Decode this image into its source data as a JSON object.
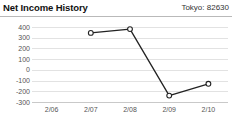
{
  "header": {
    "title": "Net Income History",
    "meta": "Tokyo: 82630"
  },
  "chart_data": {
    "type": "line",
    "title": "Net Income History",
    "subtitle": "Tokyo: 82630",
    "xlabel": "",
    "ylabel": "",
    "categories": [
      "2/06",
      "2/07",
      "2/08",
      "2/09",
      "2/10"
    ],
    "values": [
      null,
      345,
      380,
      -240,
      -130
    ],
    "series": [
      {
        "name": "Net Income",
        "values": [
          null,
          345,
          380,
          -240,
          -130
        ]
      }
    ],
    "ylim": [
      -300,
      400
    ],
    "yticks": [
      400,
      300,
      200,
      100,
      0,
      -100,
      -200,
      -300
    ],
    "ytick_labels": [
      "400",
      "300",
      "200",
      "100",
      "0",
      "-100",
      "-200",
      "-300"
    ],
    "xtick_labels": [
      "2/06",
      "2/07",
      "2/08",
      "2/09",
      "2/10"
    ],
    "grid": true,
    "legend": "none",
    "marker": "open-circle",
    "line_color": "#222222",
    "grid_color": "#e2e2e2",
    "background": "#ffffff"
  }
}
